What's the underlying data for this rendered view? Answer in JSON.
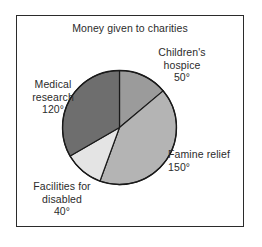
{
  "chart_data": {
    "type": "pie",
    "title": "Money given to charities",
    "xlabel": "",
    "ylabel": "",
    "unit": "degrees",
    "total": 360,
    "start_angle_deg": 0,
    "direction": "clockwise",
    "legend_position": "outside-labels",
    "grid": false,
    "categories": [
      "Children's hospice",
      "Famine relief",
      "Facilities for disabled",
      "Medical research"
    ],
    "values": [
      50,
      150,
      40,
      120
    ],
    "value_labels": [
      "50°",
      "150°",
      "40°",
      "120°"
    ],
    "colors": [
      "#9b9b9b",
      "#b4b4b4",
      "#e4e4e4",
      "#6e6e6e"
    ],
    "slices": [
      {
        "name": "Children's hospice",
        "name_line1": "Children's",
        "name_line2": "hospice",
        "value": 50,
        "value_label": "50°",
        "color": "#9b9b9b",
        "start_deg": 0,
        "end_deg": 50
      },
      {
        "name": "Famine relief",
        "name_line1": "Famine relief",
        "name_line2": "",
        "value": 150,
        "value_label": "150°",
        "color": "#b4b4b4",
        "start_deg": 50,
        "end_deg": 200
      },
      {
        "name": "Facilities for disabled",
        "name_line1": "Facilities for",
        "name_line2": "disabled",
        "value": 40,
        "value_label": "40°",
        "color": "#e4e4e4",
        "start_deg": 200,
        "end_deg": 240
      },
      {
        "name": "Medical research",
        "name_line1": "Medical",
        "name_line2": "research",
        "value": 120,
        "value_label": "120°",
        "color": "#6e6e6e",
        "start_deg": 240,
        "end_deg": 360
      }
    ]
  },
  "figure": {
    "border_color": "#2b2b2b",
    "background": "#ffffff",
    "outline_color": "#1a1a1a"
  }
}
